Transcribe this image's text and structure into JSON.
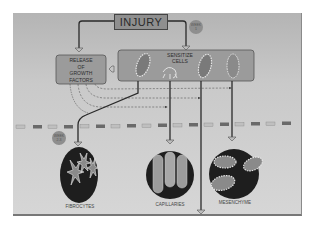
{
  "diagram": {
    "top_node": {
      "label": "INJURY"
    },
    "badges": [
      {
        "label": "WEEK 1"
      },
      {
        "label": "WEEK 2-3"
      }
    ],
    "release_box": {
      "label_lines": [
        "RELEASE",
        "OF",
        "GROWTH",
        "FACTORS"
      ]
    },
    "sensitize_box": {
      "label_lines": [
        "SENSITIZE",
        "CELLS"
      ]
    },
    "outcomes": [
      {
        "label": "FIBROCYTES"
      },
      {
        "label": "CAPILLARIES"
      },
      {
        "label": "MESENCHYME"
      }
    ],
    "colors": {
      "background": "#c8c8c8",
      "box_fill": "#9a9a9a",
      "dark_circle": "#1e1e1e",
      "cell_fill": "#8c8c8c",
      "cell_outline": "#e6e6e6",
      "line": "#2a2a2a"
    }
  }
}
